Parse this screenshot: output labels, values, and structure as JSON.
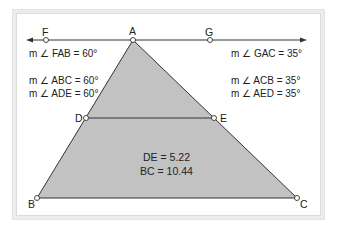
{
  "diagram": {
    "colors": {
      "triangle_fill": "#c2c2c2",
      "stroke": "#333333",
      "frame_bg": "#ececec",
      "panel_bg": "#ffffff"
    },
    "points": {
      "F": {
        "label": "F",
        "x": 46,
        "y": 40
      },
      "A": {
        "label": "A",
        "x": 133,
        "y": 40
      },
      "G": {
        "label": "G",
        "x": 210,
        "y": 40
      },
      "D": {
        "label": "D",
        "x": 86,
        "y": 118
      },
      "E": {
        "label": "E",
        "x": 214,
        "y": 118
      },
      "B": {
        "label": "B",
        "x": 37,
        "y": 198
      },
      "C": {
        "label": "C",
        "x": 297,
        "y": 198
      }
    },
    "angles_left": {
      "fab": "m ∠ FAB = 60°",
      "abc": "m ∠ ABC = 60°",
      "ade": "m ∠ ADE = 60°"
    },
    "angles_right": {
      "gac": "m ∠ GAC = 35°",
      "acb": "m ∠ ACB = 35°",
      "aed": "m ∠ AED = 35°"
    },
    "measurements": {
      "de": "DE = 5.22",
      "bc": "BC = 10.44"
    }
  }
}
